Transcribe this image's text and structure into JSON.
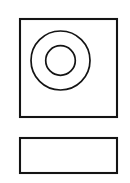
{
  "canvas": {
    "name": "technical-drawing-canvas",
    "width": 130,
    "height": 183,
    "background_color": "#ffffff",
    "grid": {
      "name": "dot-grid",
      "visible": true,
      "style": "dots",
      "spacing_px": 10,
      "dot_color": "#c9c9c9",
      "dot_radius_px": 0.55,
      "offset_x_px": 2,
      "offset_y_px": 3
    }
  },
  "drawing": {
    "title": "Counterbored Plate",
    "line_color": "#141414",
    "views": [
      {
        "name": "front-view",
        "label": "Front view",
        "shape": "square",
        "x": 20,
        "y": 19,
        "width": 97,
        "height": 98,
        "stroke_width": 2.1,
        "fill": "none",
        "features": [
          {
            "name": "outer-circle",
            "label": "Outer circle",
            "shape": "circle",
            "cx": 60.5,
            "cy": 60.5,
            "r": 29.5,
            "stroke_width": 1.7,
            "fill": "none"
          },
          {
            "name": "inner-circle",
            "label": "Inner circle",
            "shape": "circle",
            "cx": 60.5,
            "cy": 60.5,
            "r": 14.8,
            "stroke_width": 1.7,
            "fill": "none"
          }
        ]
      },
      {
        "name": "side-view",
        "label": "Side view",
        "shape": "rectangle",
        "x": 20,
        "y": 138,
        "width": 97,
        "height": 35,
        "stroke_width": 2.1,
        "fill": "none",
        "features": []
      }
    ]
  }
}
